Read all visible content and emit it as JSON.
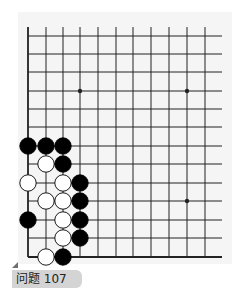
{
  "label": {
    "text": "问题 107"
  },
  "board": {
    "x_lines": [
      28,
      46,
      63,
      80,
      98,
      116,
      133,
      151,
      169,
      187,
      205
    ],
    "y_lines": [
      36,
      54,
      72,
      91,
      109,
      127,
      146,
      164,
      183,
      201,
      220,
      238,
      257
    ],
    "line_top": 27,
    "line_right": 222,
    "star_points": [
      [
        3,
        3
      ],
      [
        9,
        3
      ],
      [
        9,
        9
      ]
    ],
    "stone_radius": 8.2,
    "colors": {
      "line": "#222222",
      "black": "#000000",
      "white": "#ffffff",
      "panel": "#f5f5f5"
    },
    "stones": [
      {
        "color": "black",
        "col": 0,
        "row": 6
      },
      {
        "color": "black",
        "col": 1,
        "row": 6
      },
      {
        "color": "black",
        "col": 2,
        "row": 6
      },
      {
        "color": "white",
        "col": 1,
        "row": 7
      },
      {
        "color": "black",
        "col": 2,
        "row": 7
      },
      {
        "color": "white",
        "col": 0,
        "row": 8
      },
      {
        "color": "white",
        "col": 2,
        "row": 8
      },
      {
        "color": "black",
        "col": 3,
        "row": 8
      },
      {
        "color": "white",
        "col": 1,
        "row": 9
      },
      {
        "color": "white",
        "col": 2,
        "row": 9
      },
      {
        "color": "black",
        "col": 3,
        "row": 9
      },
      {
        "color": "black",
        "col": 0,
        "row": 10
      },
      {
        "color": "white",
        "col": 2,
        "row": 10
      },
      {
        "color": "black",
        "col": 3,
        "row": 10
      },
      {
        "color": "white",
        "col": 2,
        "row": 11
      },
      {
        "color": "black",
        "col": 3,
        "row": 11
      },
      {
        "color": "white",
        "col": 1,
        "row": 12
      },
      {
        "color": "black",
        "col": 2,
        "row": 12
      }
    ]
  }
}
